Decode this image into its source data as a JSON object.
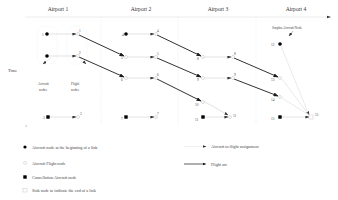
{
  "diagram": {
    "airports": [
      "Airport 1",
      "Airport 2",
      "Airport 3",
      "Airport 4"
    ],
    "time_axis_label": "Time",
    "column_labels": {
      "aircraft_nodes": [
        "Aircraft",
        "nodes"
      ],
      "flight_nodes": [
        "Flight",
        "nodes"
      ]
    },
    "surplus_label": "Surplus Aircraft Node",
    "aircraft_nodes": [
      {
        "id": "1",
        "type": "aircraft",
        "x": 47,
        "y": 34
      },
      {
        "id": "2",
        "type": "aircraft",
        "x": 47,
        "y": 56
      },
      {
        "id": "4",
        "type": "aircraft",
        "x": 126,
        "y": 34
      },
      {
        "id": "12",
        "type": "aircraft",
        "x": 280,
        "y": 44
      }
    ],
    "cancellation_nodes": [
      {
        "id": "3",
        "x": 48,
        "y": 117
      },
      {
        "id": "7",
        "x": 126,
        "y": 117
      },
      {
        "id": "11",
        "x": 203,
        "y": 117
      },
      {
        "id": "15",
        "x": 280,
        "y": 117
      }
    ],
    "flight_nodes": [
      {
        "id": "1",
        "x": 78,
        "y": 34
      },
      {
        "id": "2",
        "x": 78,
        "y": 56
      },
      {
        "id": "3",
        "x": 78,
        "y": 117
      },
      {
        "id": "4",
        "x": 156,
        "y": 34
      },
      {
        "id": "5",
        "x": 126,
        "y": 57
      },
      {
        "id": "5",
        "x": 156,
        "y": 57
      },
      {
        "id": "6",
        "x": 126,
        "y": 78
      },
      {
        "id": "6",
        "x": 156,
        "y": 78
      },
      {
        "id": "7",
        "x": 156,
        "y": 117
      },
      {
        "id": "8",
        "x": 203,
        "y": 57
      },
      {
        "id": "8",
        "x": 233,
        "y": 57
      },
      {
        "id": "9",
        "x": 203,
        "y": 78
      },
      {
        "id": "9",
        "x": 233,
        "y": 78
      },
      {
        "id": "10",
        "x": 203,
        "y": 102
      },
      {
        "id": "11",
        "x": 230,
        "y": 116
      },
      {
        "id": "13",
        "x": 280,
        "y": 78
      },
      {
        "id": "14",
        "x": 280,
        "y": 97
      }
    ],
    "sink_node": {
      "id": "15",
      "x": 311,
      "y": 117
    },
    "annotation_labels": {
      "n1": "1",
      "n2": "2",
      "n3": "3",
      "n4": "4",
      "n5": "5",
      "n6": "6",
      "n7": "7",
      "n8": "8",
      "n9": "9",
      "n10": "10",
      "n11": "11",
      "n12": "12",
      "n13": "13",
      "n14": "14",
      "n15": "15"
    }
  },
  "legend": {
    "items": [
      {
        "key": "aircraft-node",
        "label": "Aircraft node at the beginning of a link"
      },
      {
        "key": "flight-node",
        "label": "Aircraft Flight node"
      },
      {
        "key": "cancellation-node",
        "label": "Cancellation Aircraft node"
      },
      {
        "key": "sink-node",
        "label": "Sink node to indicate the end of a link"
      }
    ],
    "arcs": [
      {
        "key": "assignment",
        "label": "Aircraft to flight assignment"
      },
      {
        "key": "flight-arc",
        "label": "Flight arc"
      }
    ]
  },
  "colors": {
    "flight_arc": "#1a1a1a",
    "assignment_arc": "#c4c4c4",
    "node_fill": "#000000",
    "grid": "#d8d8d8"
  }
}
